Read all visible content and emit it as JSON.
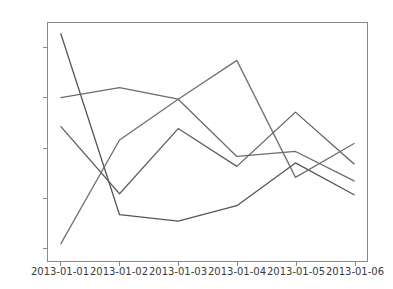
{
  "chart_data": {
    "type": "line",
    "title": "",
    "xlabel": "",
    "ylabel": "",
    "categories": [
      "2013-01-01",
      "2013-01-02",
      "2013-01-03",
      "2013-01-04",
      "2013-01-05",
      "2013-01-06"
    ],
    "x_tick_labels": [
      "2013-01-01",
      "2013-01-02",
      "2013-01-03",
      "2013-01-04",
      "2013-01-05",
      "2013-01-06"
    ],
    "y_tick_labels": [
      "2",
      "1",
      "0",
      "−1",
      "−2"
    ],
    "y_tick_values": [
      2,
      1,
      0,
      -1,
      -2
    ],
    "ylim": [
      -2.28,
      2.5
    ],
    "xlim": [
      -0.22,
      5.22
    ],
    "grid": false,
    "legend": null,
    "legend_position": "none",
    "series": [
      {
        "name": "series-1",
        "color": "#555555",
        "values": [
          2.28,
          -1.35,
          -1.48,
          -1.17,
          -0.31,
          -0.95
        ]
      },
      {
        "name": "series-2",
        "color": "#6b6b6b",
        "values": [
          1.0,
          1.2,
          0.97,
          -0.18,
          -0.08,
          -0.67
        ]
      },
      {
        "name": "series-3",
        "color": "#5f5f5f",
        "values": [
          0.42,
          -0.93,
          0.38,
          -0.38,
          0.71,
          -0.33
        ]
      },
      {
        "name": "series-4",
        "color": "#707070",
        "values": [
          -1.93,
          0.15,
          0.97,
          1.75,
          -0.6,
          0.08
        ]
      }
    ]
  },
  "figure": {
    "background_color": "#ffffff",
    "axes_edge_color": "#8a8a8a",
    "tick_label_color": "#3b3b3b"
  }
}
